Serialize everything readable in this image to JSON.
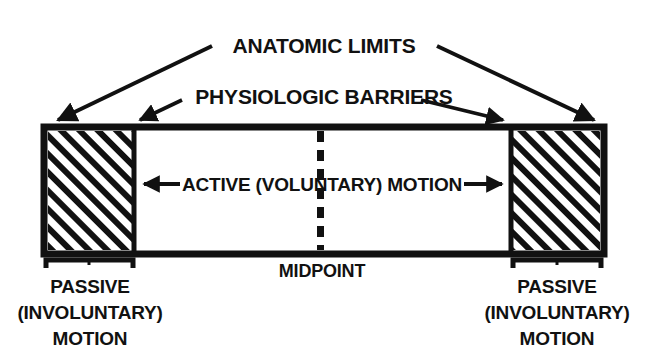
{
  "figure": {
    "background_color": "#ffffff",
    "ink_color": "#111111"
  },
  "labels": {
    "anatomic_limits": "ANATOMIC LIMITS",
    "physiologic_barriers": "PHYSIOLOGIC BARRIERS",
    "active_motion": "ACTIVE (VOLUNTARY) MOTION",
    "midpoint": "MIDPOINT",
    "passive_left": {
      "line1": "PASSIVE",
      "line2": "(INVOLUNTARY)",
      "line3": "MOTION"
    },
    "passive_right": {
      "line1": "PASSIVE",
      "line2": "(INVOLUNTARY)",
      "line3": "MOTION"
    }
  },
  "diagram_data": {
    "type": "diagram",
    "outer_box": {
      "x": 44,
      "y": 127,
      "width": 560,
      "height": 127
    },
    "zones": [
      {
        "name": "passive-left",
        "x": 44,
        "y": 127,
        "width": 90,
        "height": 127,
        "fill": "hatched"
      },
      {
        "name": "active-center",
        "x": 134,
        "y": 127,
        "width": 377,
        "height": 127,
        "fill": "white"
      },
      {
        "name": "passive-right",
        "x": 511,
        "y": 127,
        "width": 93,
        "height": 127,
        "fill": "hatched"
      }
    ],
    "midpoint_line": {
      "x": 320,
      "y1": 131,
      "y2": 250,
      "style": "dashed"
    },
    "anatomic_limit_arrows": [
      {
        "from_x": 212,
        "from_y": 46,
        "to_x": 56,
        "to_y": 121
      },
      {
        "from_x": 437,
        "from_y": 46,
        "to_x": 596,
        "to_y": 121
      }
    ],
    "physiologic_barrier_arrows": [
      {
        "from_x": 180,
        "from_y": 101,
        "to_x": 138,
        "to_y": 121
      },
      {
        "from_x": 420,
        "from_y": 101,
        "to_x": 505,
        "to_y": 121
      }
    ],
    "active_motion_arrows": [
      {
        "direction": "left",
        "x1": 178,
        "x2": 142,
        "y": 184
      },
      {
        "direction": "right",
        "x1": 466,
        "x2": 504,
        "y": 184
      }
    ],
    "brackets": [
      {
        "name": "bracket-left",
        "x1": 46,
        "x2": 133,
        "y": 259,
        "tick_height": 9
      },
      {
        "name": "bracket-right",
        "x1": 513,
        "x2": 602,
        "y": 259,
        "tick_height": 9
      }
    ]
  }
}
